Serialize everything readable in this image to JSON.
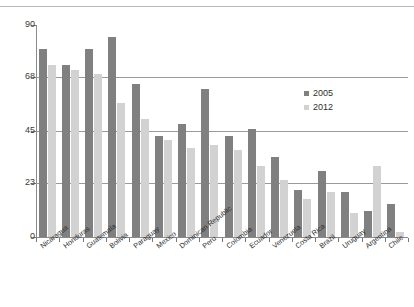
{
  "chart_data": {
    "type": "bar",
    "title": "",
    "xlabel": "",
    "ylabel": "",
    "ylim": [
      0,
      90
    ],
    "yticks": [
      0,
      23,
      45,
      68,
      90
    ],
    "grid": true,
    "legend_position": "inside-right",
    "categories": [
      "Nicaragua",
      "Honduras",
      "Guatemala",
      "Bolivia",
      "Paraguay",
      "Mexico",
      "Dominican Republic",
      "Peru",
      "Colombia",
      "Ecuador",
      "Venezuela",
      "Costa Rica",
      "Brazil",
      "Uruguay",
      "Argentina",
      "Chile"
    ],
    "series": [
      {
        "name": "2005",
        "color": "#808080",
        "values": [
          80,
          73,
          80,
          85,
          65,
          43,
          48,
          63,
          43,
          46,
          34,
          20,
          28,
          19,
          11,
          14
        ]
      },
      {
        "name": "2012",
        "color": "#d2d2d2",
        "values": [
          73,
          71,
          69,
          57,
          50,
          41,
          38,
          39,
          37,
          30,
          24,
          16,
          19,
          10,
          30,
          2
        ]
      }
    ]
  },
  "legend": {
    "entries": [
      {
        "label": "2005",
        "color": "#808080"
      },
      {
        "label": "2012",
        "color": "#d2d2d2"
      }
    ]
  }
}
